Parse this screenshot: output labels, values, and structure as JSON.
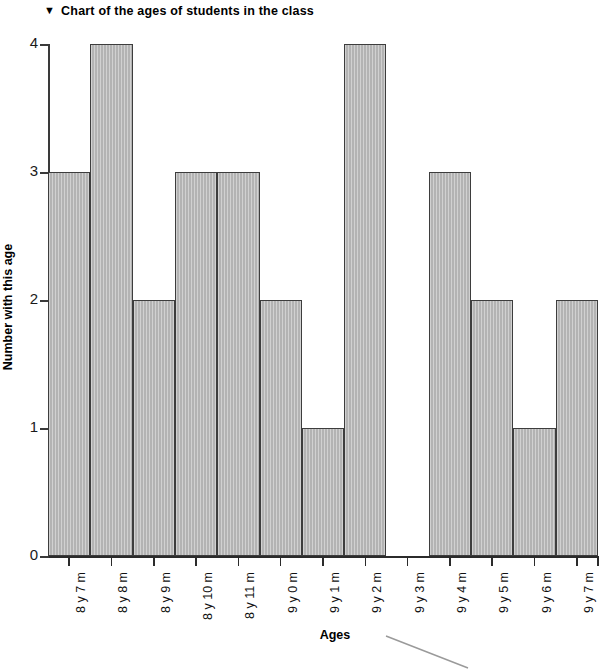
{
  "title": {
    "marker": "▼",
    "text": "Chart of the ages of students in the class"
  },
  "axes": {
    "y_title": "Number with this age",
    "x_title": "Ages",
    "y_ticks": [
      "0",
      "1",
      "2",
      "3",
      "4"
    ]
  },
  "colors": {
    "bar_fill": "#b3b3b3",
    "bar_stroke": "#3d3d3d",
    "axis": "#2b2b2b",
    "text": "#000000",
    "background": "#ffffff"
  },
  "chart_data": {
    "type": "bar",
    "title": "Chart of the ages of students in the class",
    "xlabel": "Ages",
    "ylabel": "Number with this age",
    "ylim": [
      0,
      4
    ],
    "grid": false,
    "legend": null,
    "categories": [
      "8 y 7 m",
      "8 y 8 m",
      "8 y 9 m",
      "8 y 10 m",
      "8 y 11 m",
      "9 y 0 m",
      "9 y 1 m",
      "9 y 2 m",
      "9 y 3 m",
      "9 y 4 m",
      "9 y 5 m",
      "9 y 6 m",
      "9 y 7 m"
    ],
    "values": [
      3,
      4,
      2,
      3,
      3,
      2,
      1,
      4,
      0,
      3,
      2,
      1,
      2
    ],
    "ytick_labels": [
      "0",
      "1",
      "2",
      "3",
      "4"
    ],
    "ytick_values": [
      0,
      1,
      2,
      3,
      4
    ]
  }
}
